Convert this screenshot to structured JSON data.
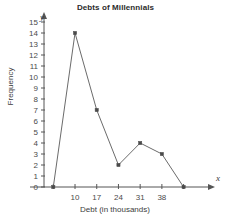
{
  "chart_data": {
    "type": "line",
    "title": "Debts of Millennials",
    "xlabel": "Debt (in thousands)",
    "ylabel": "Frequency",
    "x_axis_name": "x",
    "y_axis_name": "y",
    "x": [
      3,
      10,
      17,
      24,
      31,
      38,
      45
    ],
    "values": [
      0,
      14,
      7,
      2,
      4,
      3,
      0
    ],
    "categories": [
      "3",
      "10",
      "17",
      "24",
      "31",
      "38",
      "45"
    ],
    "xtick_labels": [
      "10",
      "17",
      "24",
      "31",
      "38"
    ],
    "xtick_values": [
      10,
      17,
      24,
      31,
      38
    ],
    "xtick_all_values": [
      3,
      10,
      17,
      24,
      31,
      38,
      45
    ],
    "ytick_labels": [
      "0",
      "1",
      "2",
      "3",
      "4",
      "5",
      "6",
      "7",
      "8",
      "9",
      "10",
      "11",
      "12",
      "13",
      "14",
      "15"
    ],
    "xlim": [
      0,
      49
    ],
    "ylim": [
      0,
      15
    ],
    "grid": false,
    "legend": null,
    "legend_position": "none",
    "line_color": "#6b6b6b",
    "marker_color": "#4a4a4a",
    "axis_color": "#555555",
    "marker": "square",
    "points": [
      {
        "x": 3,
        "y": 0
      },
      {
        "x": 10,
        "y": 14
      },
      {
        "x": 17,
        "y": 7
      },
      {
        "x": 24,
        "y": 2
      },
      {
        "x": 31,
        "y": 4
      },
      {
        "x": 38,
        "y": 3
      },
      {
        "x": 45,
        "y": 0
      }
    ]
  }
}
